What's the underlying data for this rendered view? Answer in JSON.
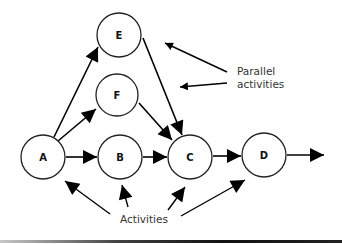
{
  "diagram": {
    "type": "activity-network",
    "nodes": [
      {
        "id": "A",
        "label": "A",
        "cx": 43,
        "cy": 157,
        "r": 22
      },
      {
        "id": "B",
        "label": "B",
        "cx": 120,
        "cy": 157,
        "r": 22
      },
      {
        "id": "C",
        "label": "C",
        "cx": 190,
        "cy": 157,
        "r": 22
      },
      {
        "id": "D",
        "label": "D",
        "cx": 264,
        "cy": 155,
        "r": 22
      },
      {
        "id": "E",
        "label": "E",
        "cx": 119,
        "cy": 35,
        "r": 22
      },
      {
        "id": "F",
        "label": "F",
        "cx": 117,
        "cy": 95,
        "r": 21
      }
    ],
    "edges": [
      {
        "from": "A",
        "to": "E"
      },
      {
        "from": "A",
        "to": "F"
      },
      {
        "from": "A",
        "to": "B"
      },
      {
        "from": "B",
        "to": "C"
      },
      {
        "from": "E",
        "to": "C"
      },
      {
        "from": "F",
        "to": "C"
      },
      {
        "from": "C",
        "to": "D"
      },
      {
        "from": "D",
        "to": "out"
      }
    ],
    "annotations": {
      "parallel": {
        "line1": "Parallel",
        "line2": "activities"
      },
      "activities": {
        "label": "Activities"
      }
    }
  }
}
